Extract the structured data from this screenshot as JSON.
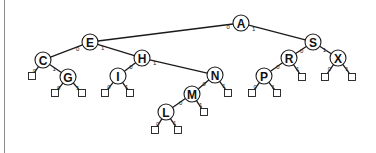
{
  "diagram": {
    "colors": {
      "stroke": "#1a1a1a",
      "fill": "#ffffff",
      "border": "#8a8a8a"
    },
    "node_radius": 8,
    "leaf_size": 7,
    "nodes": [
      {
        "id": "A",
        "label": "A",
        "x": 241,
        "y": 23
      },
      {
        "id": "E",
        "label": "E",
        "x": 90,
        "y": 42
      },
      {
        "id": "S",
        "label": "S",
        "x": 313,
        "y": 42
      },
      {
        "id": "C",
        "label": "C",
        "x": 43,
        "y": 60
      },
      {
        "id": "H",
        "label": "H",
        "x": 142,
        "y": 58
      },
      {
        "id": "G",
        "label": "G",
        "x": 68,
        "y": 77
      },
      {
        "id": "I",
        "label": "I",
        "x": 118,
        "y": 76
      },
      {
        "id": "N",
        "label": "N",
        "x": 215,
        "y": 75
      },
      {
        "id": "M",
        "label": "M",
        "x": 192,
        "y": 94
      },
      {
        "id": "L",
        "label": "L",
        "x": 166,
        "y": 112
      },
      {
        "id": "R",
        "label": "R",
        "x": 289,
        "y": 58
      },
      {
        "id": "P",
        "label": "P",
        "x": 264,
        "y": 76
      },
      {
        "id": "X",
        "label": "X",
        "x": 338,
        "y": 58
      }
    ],
    "leaves": [
      {
        "id": "C0",
        "x": 32,
        "y": 76
      },
      {
        "id": "G0",
        "x": 55,
        "y": 93
      },
      {
        "id": "G1",
        "x": 82,
        "y": 93
      },
      {
        "id": "I0",
        "x": 105,
        "y": 93
      },
      {
        "id": "I1",
        "x": 130,
        "y": 93
      },
      {
        "id": "N1",
        "x": 228,
        "y": 93
      },
      {
        "id": "M1",
        "x": 204,
        "y": 112
      },
      {
        "id": "L0",
        "x": 155,
        "y": 130
      },
      {
        "id": "L1",
        "x": 178,
        "y": 130
      },
      {
        "id": "P0",
        "x": 252,
        "y": 93
      },
      {
        "id": "P1",
        "x": 277,
        "y": 93
      },
      {
        "id": "R1",
        "x": 302,
        "y": 77
      },
      {
        "id": "X0",
        "x": 325,
        "y": 77
      },
      {
        "id": "X1",
        "x": 352,
        "y": 77
      }
    ],
    "edges": [
      {
        "from": "A",
        "to": "E",
        "bit": "0"
      },
      {
        "from": "A",
        "to": "S",
        "bit": "1"
      },
      {
        "from": "E",
        "to": "C",
        "bit": "0"
      },
      {
        "from": "E",
        "to": "H",
        "bit": "1"
      },
      {
        "from": "C",
        "to": "C0",
        "bit": "0"
      },
      {
        "from": "C",
        "to": "G",
        "bit": "1"
      },
      {
        "from": "G",
        "to": "G0",
        "bit": "0"
      },
      {
        "from": "G",
        "to": "G1",
        "bit": "1"
      },
      {
        "from": "H",
        "to": "I",
        "bit": "0"
      },
      {
        "from": "H",
        "to": "N",
        "bit": "1"
      },
      {
        "from": "I",
        "to": "I0",
        "bit": "0"
      },
      {
        "from": "I",
        "to": "I1",
        "bit": "1"
      },
      {
        "from": "N",
        "to": "M",
        "bit": "0"
      },
      {
        "from": "N",
        "to": "N1",
        "bit": "1"
      },
      {
        "from": "M",
        "to": "L",
        "bit": "0"
      },
      {
        "from": "M",
        "to": "M1",
        "bit": "1"
      },
      {
        "from": "L",
        "to": "L0",
        "bit": "0"
      },
      {
        "from": "L",
        "to": "L1",
        "bit": "1"
      },
      {
        "from": "S",
        "to": "R",
        "bit": "0"
      },
      {
        "from": "S",
        "to": "X",
        "bit": "1"
      },
      {
        "from": "R",
        "to": "P",
        "bit": "0"
      },
      {
        "from": "R",
        "to": "R1",
        "bit": "1"
      },
      {
        "from": "P",
        "to": "P0",
        "bit": "0"
      },
      {
        "from": "P",
        "to": "P1",
        "bit": "1"
      },
      {
        "from": "X",
        "to": "X0",
        "bit": "0"
      },
      {
        "from": "X",
        "to": "X1",
        "bit": "1"
      }
    ]
  }
}
